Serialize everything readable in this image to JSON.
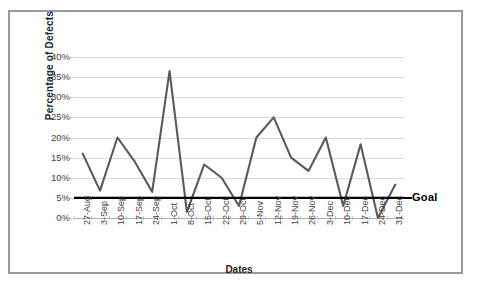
{
  "chart_data": {
    "type": "line",
    "title": "",
    "xlabel": "Dates",
    "ylabel": "Percentage of Defects",
    "ylim": [
      0,
      40
    ],
    "ytick_labels": [
      "40%",
      "35%",
      "30%",
      "25%",
      "20%",
      "15%",
      "10%",
      "5%",
      "0%"
    ],
    "ytick_values": [
      40,
      35,
      30,
      25,
      20,
      15,
      10,
      5,
      0
    ],
    "grid": true,
    "legend": "none",
    "categories": [
      "27-Aug",
      "3-Sep",
      "10-Sep",
      "17-Sep",
      "24-Sep",
      "1-Oct",
      "8-Oct",
      "15-Oct",
      "22-Oct",
      "29-Oct",
      "5-Nov",
      "12-Nov",
      "19-Nov",
      "26-Nov",
      "3-Dec",
      "10-Dec",
      "17-Dec",
      "24-Dec",
      "31-Dec"
    ],
    "series": [
      {
        "name": "Percentage of Defects",
        "color": "#595959",
        "values": [
          16.0,
          6.8,
          20.0,
          14.0,
          6.5,
          36.5,
          1.5,
          13.3,
          10.0,
          3.0,
          20.0,
          25.0,
          15.0,
          11.7,
          20.0,
          3.0,
          18.3,
          0.0,
          8.3
        ]
      }
    ],
    "reference_line": {
      "label": "Goal",
      "value": 5,
      "color": "#000000"
    },
    "colors": {
      "series_line": "#595959",
      "gridline": "#d9d9d9",
      "goal_line": "#000000",
      "frame_border": "#9a9a9a",
      "axis_text": "#3f3f3f",
      "title_text": "#262626",
      "background": "#ffffff"
    }
  }
}
